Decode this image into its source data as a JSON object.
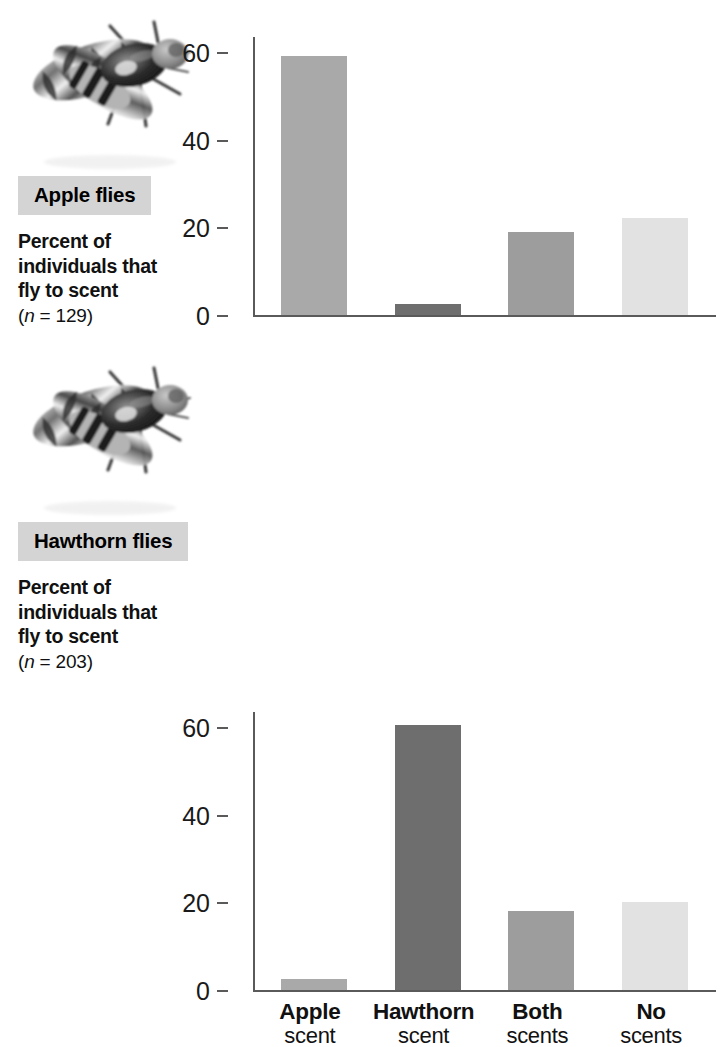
{
  "figure": {
    "background": "#ffffff"
  },
  "panels": [
    {
      "id": "apple-flies",
      "species_label": "Apple flies",
      "caption_line1": "Percent of",
      "caption_line2": "individuals that",
      "caption_line3": "fly to scent",
      "sample_prefix": "(",
      "sample_italic": "n",
      "sample_value": " = 129)",
      "illustration_name": "apple-fly-photo"
    },
    {
      "id": "hawthorn-flies",
      "species_label": "Hawthorn flies",
      "caption_line1": "Percent of",
      "caption_line2": "individuals that",
      "caption_line3": "fly to scent",
      "sample_prefix": "(",
      "sample_italic": "n",
      "sample_value": " = 203)",
      "illustration_name": "hawthorn-fly-photo"
    }
  ],
  "axis": {
    "ticks": [
      "0",
      "20",
      "40",
      "60"
    ],
    "tick_values": [
      0,
      20,
      40,
      60
    ],
    "ymin": 0,
    "ymax": 62
  },
  "categories": [
    {
      "main": "Apple",
      "sub": "scent"
    },
    {
      "main": "Hawthorn",
      "sub": "scent"
    },
    {
      "main": "Both",
      "sub": "scents"
    },
    {
      "main": "No",
      "sub": "scents"
    }
  ],
  "colors": {
    "apple_bar": "#a9a9a9",
    "hawthorn_bar": "#6e6e6e",
    "both_bar": "#9d9d9d",
    "no_bar": "#e2e2e2",
    "axis": "#5a5a5a",
    "badge_bg": "#d4d4d4",
    "text": "#111111"
  },
  "chart_data": [
    {
      "type": "bar",
      "title": "Apple flies",
      "subtitle": "Percent of individuals that fly to scent (n = 129)",
      "categories": [
        "Apple scent",
        "Hawthorn scent",
        "Both scents",
        "No scents"
      ],
      "values": [
        59,
        2.5,
        19,
        22
      ],
      "colors": [
        "#a9a9a9",
        "#6e6e6e",
        "#9d9d9d",
        "#e2e2e2"
      ],
      "xlabel": "",
      "ylabel": "Percent of individuals that fly to scent",
      "ylim": [
        0,
        62
      ],
      "yticks": [
        0,
        20,
        40,
        60
      ],
      "grid": false,
      "legend": "none",
      "n": 129
    },
    {
      "type": "bar",
      "title": "Hawthorn flies",
      "subtitle": "Percent of individuals that fly to scent (n = 203)",
      "categories": [
        "Apple scent",
        "Hawthorn scent",
        "Both scents",
        "No scents"
      ],
      "values": [
        2.5,
        60.5,
        18,
        20
      ],
      "colors": [
        "#a9a9a9",
        "#6e6e6e",
        "#9d9d9d",
        "#e2e2e2"
      ],
      "xlabel": "",
      "ylabel": "Percent of individuals that fly to scent",
      "ylim": [
        0,
        62
      ],
      "yticks": [
        0,
        20,
        40,
        60
      ],
      "grid": false,
      "legend": "none",
      "n": 203
    }
  ]
}
